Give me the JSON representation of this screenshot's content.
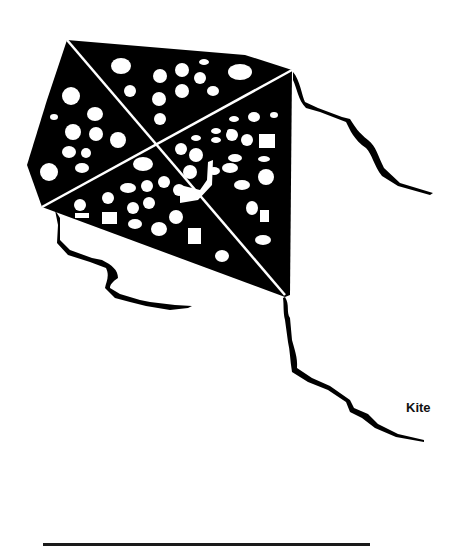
{
  "illustration": {
    "subject": "kite",
    "label": "Kite",
    "colors": {
      "fill": "#000000",
      "pattern": "#ffffff",
      "background": "#ffffff",
      "baseline": "#1a1a1a"
    }
  }
}
